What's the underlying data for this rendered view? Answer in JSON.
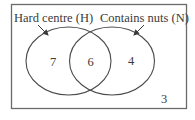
{
  "diagram": {
    "type": "venn",
    "universal_set": {
      "outside_count": "3"
    },
    "sets": [
      {
        "id": "H",
        "label": "Hard centre (H)",
        "only_count": "7"
      },
      {
        "id": "N",
        "label": "Contains nuts (N)",
        "only_count": "4"
      }
    ],
    "intersection": {
      "sets": [
        "H",
        "N"
      ],
      "count": "6"
    },
    "colors": {
      "stroke": "#555555",
      "text": "#3a3a3a",
      "background": "#ffffff"
    }
  }
}
